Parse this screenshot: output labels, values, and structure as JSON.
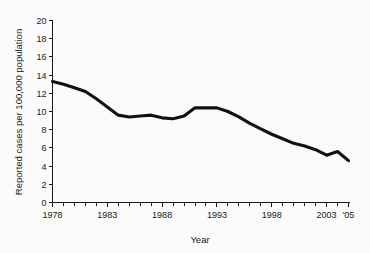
{
  "chart_data": {
    "type": "line",
    "title": "",
    "xlabel": "Year",
    "ylabel": "Reported cases per 100,000 population",
    "xlim": [
      1978,
      2005
    ],
    "ylim": [
      0,
      20
    ],
    "grid": false,
    "legend": null,
    "y_ticks": [
      "0",
      "2",
      "4",
      "6",
      "8",
      "10",
      "12",
      "14",
      "16",
      "18",
      "20"
    ],
    "y_tick_values": [
      0,
      2,
      4,
      6,
      8,
      10,
      12,
      14,
      16,
      18,
      20
    ],
    "x_tick_labels": [
      "1978",
      "1983",
      "1988",
      "1993",
      "1998",
      "2003",
      "'05"
    ],
    "x_tick_values": [
      1978,
      1983,
      1988,
      1993,
      1998,
      2003,
      2005
    ],
    "x_minor_step": 1,
    "line_color": "#111111",
    "x": [
      1978,
      1979,
      1980,
      1981,
      1982,
      1983,
      1984,
      1985,
      1986,
      1987,
      1988,
      1989,
      1990,
      1991,
      1992,
      1993,
      1994,
      1995,
      1996,
      1997,
      1998,
      1999,
      2000,
      2001,
      2002,
      2003,
      2004,
      2005
    ],
    "values": [
      13.3,
      13.0,
      12.6,
      12.2,
      11.4,
      10.5,
      9.6,
      9.4,
      9.5,
      9.6,
      9.3,
      9.2,
      9.5,
      10.4,
      10.4,
      10.4,
      10.0,
      9.4,
      8.7,
      8.1,
      7.5,
      7.0,
      6.5,
      6.2,
      5.8,
      5.2,
      5.6,
      4.6
    ],
    "series_name": "Reported cases per 100,000 population"
  }
}
